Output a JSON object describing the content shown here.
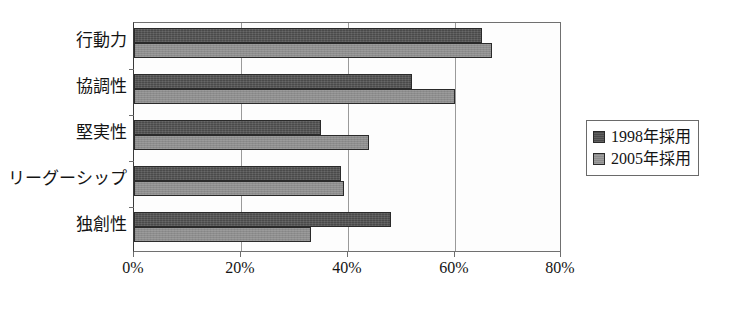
{
  "chart_data": {
    "type": "bar",
    "orientation": "horizontal",
    "title": "",
    "xlabel": "",
    "ylabel": "",
    "xlim": [
      0,
      80
    ],
    "xunit": "%",
    "xticks": [
      0,
      20,
      40,
      60,
      80
    ],
    "xtick_labels": [
      "0%",
      "20%",
      "40%",
      "60%",
      "80%"
    ],
    "grid": true,
    "grid_axis": "x",
    "legend_position": "right",
    "categories": [
      "行動力",
      "協調性",
      "堅実性",
      "リーグーシップ",
      "独創性"
    ],
    "series": [
      {
        "name": "1998年採用",
        "color": "#4a4a4a",
        "values": [
          65,
          52,
          35,
          38.7,
          48
        ]
      },
      {
        "name": "2005年採用",
        "color": "#8d8d8d",
        "values": [
          67,
          60,
          44,
          39.3,
          33
        ]
      }
    ]
  },
  "legend": {
    "entries": [
      {
        "label": "1998年採用",
        "swatch": "dark-swatch-icon"
      },
      {
        "label": "2005年採用",
        "swatch": "light-swatch-icon"
      }
    ]
  },
  "colors": {
    "series_1998": "#4a4a4a",
    "series_2005": "#8d8d8d",
    "plot_border": "#707070",
    "gridline": "#9a9a9a",
    "background": "#ffffff",
    "text": "#141414"
  }
}
